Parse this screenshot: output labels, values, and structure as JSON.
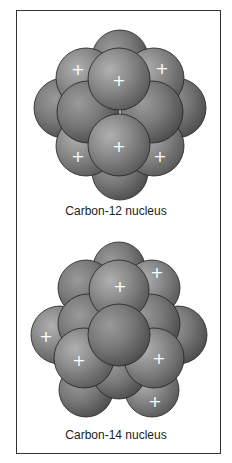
{
  "figure": {
    "nuclei": [
      {
        "caption": "Carbon-12 nucleus",
        "protons": 6,
        "neutrons": 6,
        "proton_symbol": "+"
      },
      {
        "caption": "Carbon-14 nucleus",
        "protons": 6,
        "neutrons": 8,
        "proton_symbol": "+"
      }
    ],
    "colors": {
      "sphere": "#8a8a8a",
      "sphere_dark": "#5e5e5e",
      "outline": "#222222",
      "frame": "#333333"
    }
  }
}
